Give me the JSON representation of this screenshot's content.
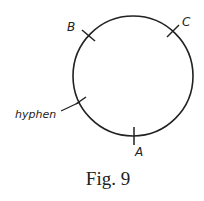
{
  "figure": {
    "caption": "Fig. 9",
    "circle": {
      "cx": 133,
      "cy": 76,
      "r": 60,
      "stroke": "#222222"
    },
    "marks": [
      {
        "id": "B",
        "label": "B",
        "tick": [
          82,
          30,
          95,
          41
        ],
        "label_pos": [
          69,
          30
        ]
      },
      {
        "id": "C",
        "label": "C",
        "tick": [
          167,
          37,
          179,
          25
        ],
        "label_pos": [
          182,
          25
        ]
      },
      {
        "id": "hyphen",
        "label": "hyphen",
        "tick": [
          76,
          104,
          86,
          97
        ],
        "leader": [
          61,
          111,
          80,
          102
        ],
        "label_pos": [
          15,
          118
        ]
      },
      {
        "id": "A",
        "label": "A",
        "tick": [
          134,
          127,
          134,
          145
        ],
        "label_pos": [
          136,
          156
        ]
      }
    ]
  }
}
